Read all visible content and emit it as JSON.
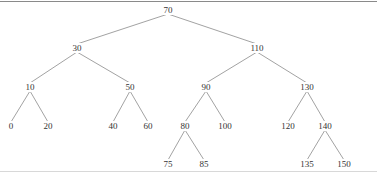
{
  "diagram": {
    "type": "binary-search-tree",
    "edge_color": "#8a8a8a",
    "nodes": [
      {
        "id": "n70",
        "label": "70",
        "x": 168,
        "y": 10
      },
      {
        "id": "n30",
        "label": "30",
        "x": 77,
        "y": 48
      },
      {
        "id": "n110",
        "label": "110",
        "x": 257,
        "y": 48
      },
      {
        "id": "n10",
        "label": "10",
        "x": 30,
        "y": 87
      },
      {
        "id": "n50",
        "label": "50",
        "x": 130,
        "y": 87
      },
      {
        "id": "n90",
        "label": "90",
        "x": 206,
        "y": 87
      },
      {
        "id": "n130",
        "label": "130",
        "x": 307,
        "y": 87
      },
      {
        "id": "n0",
        "label": "0",
        "x": 11,
        "y": 126
      },
      {
        "id": "n20",
        "label": "20",
        "x": 48,
        "y": 126
      },
      {
        "id": "n40",
        "label": "40",
        "x": 113,
        "y": 126
      },
      {
        "id": "n60",
        "label": "60",
        "x": 148,
        "y": 126
      },
      {
        "id": "n80",
        "label": "80",
        "x": 185,
        "y": 126
      },
      {
        "id": "n100",
        "label": "100",
        "x": 225,
        "y": 126
      },
      {
        "id": "n120",
        "label": "120",
        "x": 288,
        "y": 126
      },
      {
        "id": "n140",
        "label": "140",
        "x": 325,
        "y": 126
      },
      {
        "id": "n75",
        "label": "75",
        "x": 168,
        "y": 164
      },
      {
        "id": "n85",
        "label": "85",
        "x": 204,
        "y": 164
      },
      {
        "id": "n135",
        "label": "135",
        "x": 307,
        "y": 164
      },
      {
        "id": "n150",
        "label": "150",
        "x": 344,
        "y": 164
      }
    ],
    "edges": [
      [
        "n70",
        "n30"
      ],
      [
        "n70",
        "n110"
      ],
      [
        "n30",
        "n10"
      ],
      [
        "n30",
        "n50"
      ],
      [
        "n110",
        "n90"
      ],
      [
        "n110",
        "n130"
      ],
      [
        "n10",
        "n0"
      ],
      [
        "n10",
        "n20"
      ],
      [
        "n50",
        "n40"
      ],
      [
        "n50",
        "n60"
      ],
      [
        "n90",
        "n80"
      ],
      [
        "n90",
        "n100"
      ],
      [
        "n130",
        "n120"
      ],
      [
        "n130",
        "n140"
      ],
      [
        "n80",
        "n75"
      ],
      [
        "n80",
        "n85"
      ],
      [
        "n140",
        "n135"
      ],
      [
        "n140",
        "n150"
      ]
    ]
  }
}
